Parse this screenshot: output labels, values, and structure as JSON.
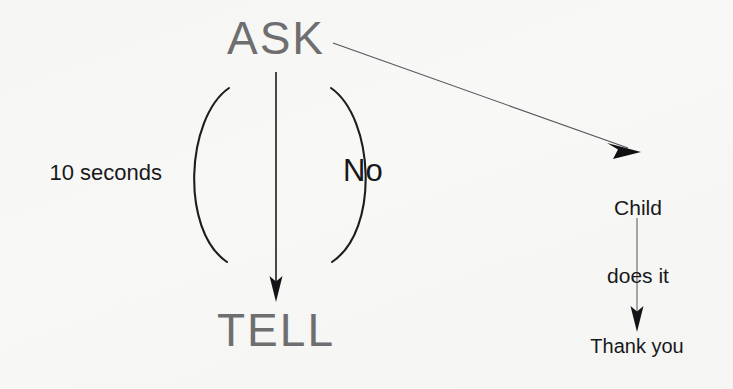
{
  "diagram": {
    "type": "flowchart",
    "background_color": "#f8f8f7",
    "nodes": [
      {
        "id": "ask",
        "label": "ASK",
        "style": "headline",
        "color": "#6f6f70"
      },
      {
        "id": "tell",
        "label": "TELL",
        "style": "headline",
        "color": "#6f6f70"
      },
      {
        "id": "child_does",
        "label": "Child\ndoes it",
        "style": "plain",
        "color": "#18181a"
      },
      {
        "id": "thank_you",
        "label": "Thank you",
        "style": "plain",
        "color": "#18181a"
      }
    ],
    "edges": [
      {
        "id": "ask-to-tell",
        "from": "ask",
        "to": "tell",
        "label": "",
        "shape": "straight-down",
        "arrow": true
      },
      {
        "id": "ask-loop-left",
        "from": "ask",
        "to": "tell",
        "label": "10 seconds",
        "shape": "arc-left",
        "arrow": false
      },
      {
        "id": "ask-loop-right",
        "from": "ask",
        "to": "tell",
        "label": "No",
        "shape": "arc-right",
        "arrow": false
      },
      {
        "id": "ask-to-child",
        "from": "ask",
        "to": "child_does",
        "label": "",
        "shape": "diagonal",
        "arrow": true
      },
      {
        "id": "child-to-thank-you",
        "from": "child_does",
        "to": "thank_you",
        "label": "",
        "shape": "straight-down",
        "arrow": true
      }
    ],
    "labels": {
      "ask": "ASK",
      "tell": "TELL",
      "no": "No",
      "ten_seconds": "10 seconds",
      "child_line_1": "Child",
      "child_line_2": "does it",
      "child_does_it": "Child does it",
      "thank_you": "Thank you"
    },
    "colors": {
      "headline_text": "#6f6f70",
      "label_text": "#18181a",
      "stroke": "#1d1d1f",
      "thin_stroke": "#4a4a4c"
    }
  }
}
